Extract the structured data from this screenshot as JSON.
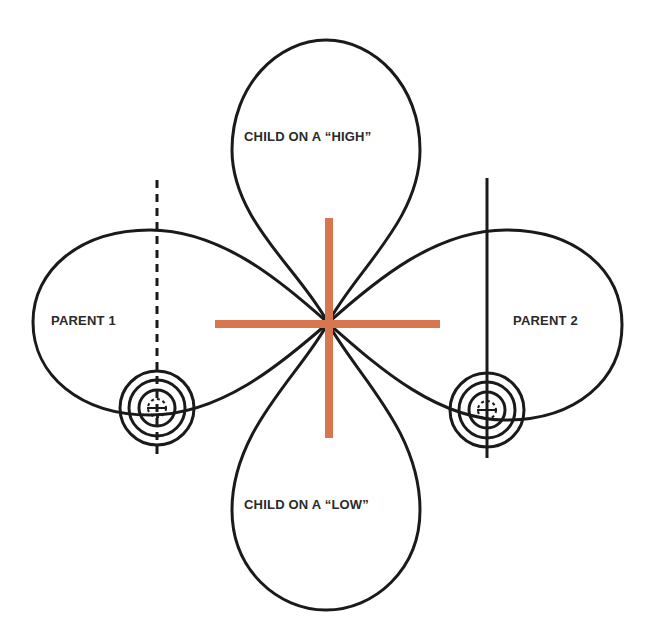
{
  "diagram": {
    "labels": {
      "top_lobe": "CHILD ON A “HIGH”",
      "bottom_lobe": "CHILD ON A “LOW”",
      "left_lobe": "PARENT 1",
      "right_lobe": "PARENT 2"
    },
    "colors": {
      "lobe_stroke": "#1a1a1a",
      "center_cross": "#d8764f",
      "background": "#ffffff"
    },
    "elements": {
      "center_cross": "orange crosshair at intersection of all four lobes",
      "left_axis": "dashed vertical line through Parent 1 lobe",
      "right_axis": "solid vertical line through Parent 2 lobe",
      "left_target": "concentric target / crosshair symbol on Parent 1 lobe",
      "right_target": "concentric target / crosshair symbol on Parent 2 lobe"
    }
  }
}
